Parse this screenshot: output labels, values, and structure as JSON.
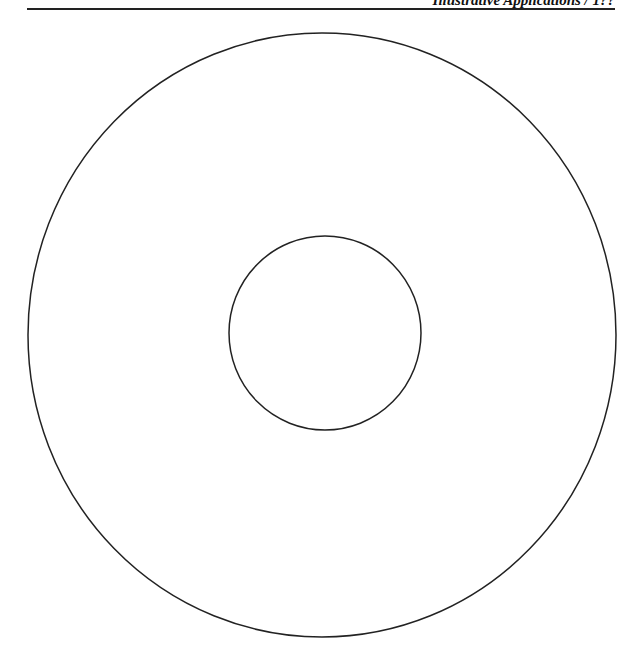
{
  "page": {
    "running_head": "Illustrative Applications / 1??",
    "header_rule": true
  },
  "figure": {
    "stroke_color": "#222222",
    "outer_circle": {
      "cx": 322,
      "cy": 335,
      "rx": 294,
      "ry": 302
    },
    "inner_circle": {
      "cx": 325,
      "cy": 333,
      "rx": 96,
      "ry": 97
    }
  }
}
